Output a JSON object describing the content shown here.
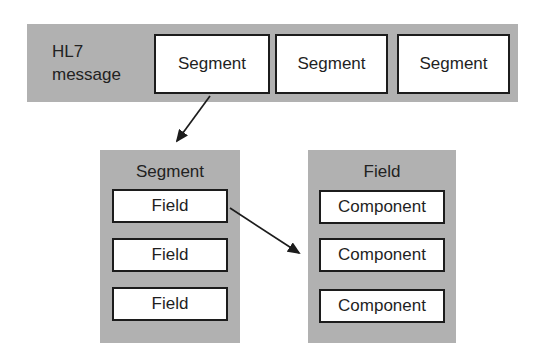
{
  "diagram": {
    "hl7_bar": {
      "label": "HL7\nmessage",
      "segments": [
        "Segment",
        "Segment",
        "Segment"
      ]
    },
    "segment_panel": {
      "title": "Segment",
      "fields": [
        "Field",
        "Field",
        "Field"
      ]
    },
    "field_panel": {
      "title": "Field",
      "components": [
        "Component",
        "Component",
        "Component"
      ]
    },
    "colors": {
      "panel_gray": "#b1b1b1",
      "box_fill": "#ffffff",
      "box_border": "#1c1c1c",
      "arrow": "#1c1c1c",
      "text": "#1f1f1f"
    }
  }
}
